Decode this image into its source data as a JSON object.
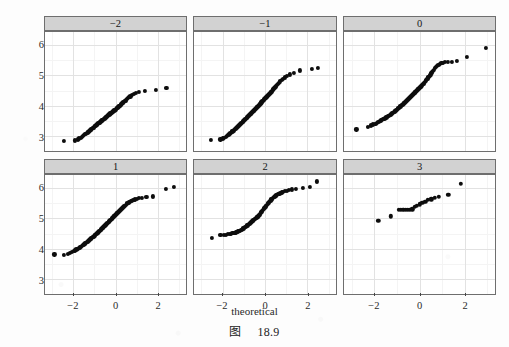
{
  "figure": {
    "caption_cjk": "图",
    "caption_number": "18.9"
  },
  "axes": {
    "x_label": "theoretical",
    "y_label": "sample",
    "x_ticks": [
      "-2",
      "0",
      "2"
    ],
    "x_tick_values": [
      -2,
      0,
      2
    ],
    "y_ticks": [
      "3",
      "4",
      "5",
      "6"
    ],
    "y_tick_values": [
      3,
      4,
      5,
      6
    ],
    "x_range": [
      -3.35,
      3.35
    ],
    "y_range": [
      2.52,
      6.42
    ],
    "x_minor_values": [
      -3,
      -1,
      1,
      3
    ],
    "y_minor_values": [
      2.5,
      3.5,
      4.5,
      5.5,
      6.5
    ]
  },
  "style": {
    "strip_background": "#d2d2d2",
    "panel_background": "#ffffff",
    "panel_border": "#6e6e6e",
    "grid_major": "#e2e2e2",
    "grid_minor": "#f4f4f4",
    "point_color": "#0d0d0d",
    "page_background": "#fdfdfd"
  },
  "chart_data": {
    "type": "scatter",
    "title": "",
    "subtitle": "",
    "xlabel": "theoretical",
    "ylabel": "sample",
    "xlim": [
      -3.35,
      3.35
    ],
    "ylim": [
      2.52,
      6.42
    ],
    "grid": true,
    "legend": "none",
    "facet_layout": {
      "rows": 2,
      "cols": 3,
      "strip_position": "top"
    },
    "annotations": [
      "图 18.9"
    ],
    "panels": [
      {
        "label": "-2",
        "row": 0,
        "col": 0,
        "n": 86,
        "x": [
          -2.45,
          -1.92,
          -1.8,
          -1.72,
          -1.66,
          -1.6,
          -1.55,
          -1.5,
          -1.46,
          -1.41,
          -1.37,
          -1.33,
          -1.29,
          -1.26,
          -1.22,
          -1.19,
          -1.15,
          -1.12,
          -1.09,
          -1.05,
          -1.02,
          -0.99,
          -0.96,
          -0.93,
          -0.9,
          -0.87,
          -0.84,
          -0.81,
          -0.78,
          -0.76,
          -0.73,
          -0.7,
          -0.67,
          -0.64,
          -0.62,
          -0.59,
          -0.56,
          -0.53,
          -0.51,
          -0.48,
          -0.45,
          -0.43,
          -0.4,
          -0.37,
          -0.35,
          -0.32,
          -0.29,
          -0.27,
          -0.24,
          -0.21,
          -0.19,
          -0.16,
          -0.13,
          -0.11,
          -0.08,
          -0.05,
          -0.03,
          0.0,
          0.03,
          0.05,
          0.08,
          0.11,
          0.13,
          0.16,
          0.19,
          0.21,
          0.24,
          0.27,
          0.3,
          0.33,
          0.36,
          0.4,
          0.43,
          0.47,
          0.51,
          0.55,
          0.6,
          0.65,
          0.71,
          0.78,
          0.87,
          0.98,
          1.13,
          1.38,
          1.92,
          2.42
        ],
        "y": [
          2.86,
          2.87,
          2.9,
          2.93,
          2.96,
          2.99,
          3.02,
          3.05,
          3.07,
          3.09,
          3.11,
          3.13,
          3.15,
          3.17,
          3.19,
          3.21,
          3.23,
          3.25,
          3.27,
          3.29,
          3.31,
          3.33,
          3.34,
          3.36,
          3.38,
          3.39,
          3.41,
          3.43,
          3.44,
          3.46,
          3.48,
          3.49,
          3.51,
          3.52,
          3.54,
          3.55,
          3.57,
          3.58,
          3.6,
          3.61,
          3.63,
          3.64,
          3.66,
          3.67,
          3.69,
          3.7,
          3.72,
          3.73,
          3.75,
          3.76,
          3.78,
          3.79,
          3.81,
          3.82,
          3.84,
          3.85,
          3.87,
          3.88,
          3.9,
          3.92,
          3.93,
          3.95,
          3.96,
          3.98,
          4.0,
          4.01,
          4.03,
          4.05,
          4.07,
          4.09,
          4.11,
          4.13,
          4.15,
          4.17,
          4.2,
          4.22,
          4.25,
          4.28,
          4.31,
          4.35,
          4.39,
          4.43,
          4.46,
          4.49,
          4.51,
          4.59
        ]
      },
      {
        "label": "-1",
        "row": 0,
        "col": 1,
        "n": 92,
        "x": [
          -2.55,
          -2.1,
          -2.0,
          -1.92,
          -1.85,
          -1.79,
          -1.73,
          -1.68,
          -1.63,
          -1.58,
          -1.54,
          -1.49,
          -1.45,
          -1.41,
          -1.37,
          -1.34,
          -1.3,
          -1.26,
          -1.23,
          -1.19,
          -1.16,
          -1.12,
          -1.09,
          -1.06,
          -1.03,
          -0.99,
          -0.96,
          -0.93,
          -0.9,
          -0.87,
          -0.84,
          -0.81,
          -0.78,
          -0.75,
          -0.72,
          -0.69,
          -0.66,
          -0.63,
          -0.61,
          -0.58,
          -0.55,
          -0.52,
          -0.49,
          -0.47,
          -0.44,
          -0.41,
          -0.38,
          -0.36,
          -0.33,
          -0.3,
          -0.28,
          -0.25,
          -0.22,
          -0.2,
          -0.17,
          -0.14,
          -0.12,
          -0.09,
          -0.06,
          -0.04,
          -0.01,
          0.02,
          0.04,
          0.07,
          0.1,
          0.12,
          0.15,
          0.18,
          0.21,
          0.24,
          0.27,
          0.3,
          0.33,
          0.36,
          0.39,
          0.42,
          0.46,
          0.49,
          0.53,
          0.57,
          0.62,
          0.67,
          0.72,
          0.78,
          0.85,
          0.93,
          1.03,
          1.16,
          1.35,
          1.65,
          2.2,
          2.48
        ],
        "y": [
          2.88,
          2.9,
          2.93,
          2.96,
          2.99,
          3.02,
          3.05,
          3.08,
          3.11,
          3.14,
          3.16,
          3.19,
          3.21,
          3.24,
          3.26,
          3.29,
          3.31,
          3.33,
          3.36,
          3.38,
          3.4,
          3.43,
          3.45,
          3.47,
          3.49,
          3.52,
          3.54,
          3.56,
          3.58,
          3.6,
          3.62,
          3.64,
          3.67,
          3.69,
          3.71,
          3.73,
          3.75,
          3.77,
          3.79,
          3.81,
          3.83,
          3.85,
          3.87,
          3.89,
          3.91,
          3.93,
          3.95,
          3.97,
          3.99,
          4.01,
          4.03,
          4.05,
          4.07,
          4.09,
          4.11,
          4.13,
          4.15,
          4.17,
          4.19,
          4.21,
          4.23,
          4.25,
          4.27,
          4.29,
          4.31,
          4.33,
          4.35,
          4.37,
          4.4,
          4.42,
          4.44,
          4.47,
          4.49,
          4.52,
          4.54,
          4.57,
          4.6,
          4.63,
          4.66,
          4.69,
          4.72,
          4.76,
          4.8,
          4.84,
          4.88,
          4.93,
          4.98,
          5.03,
          5.09,
          5.16,
          5.21,
          5.25
        ]
      },
      {
        "label": "0",
        "row": 0,
        "col": 2,
        "n": 96,
        "x": [
          -2.8,
          -2.3,
          -2.15,
          -2.05,
          -1.96,
          -1.89,
          -1.82,
          -1.76,
          -1.71,
          -1.66,
          -1.61,
          -1.56,
          -1.52,
          -1.47,
          -1.43,
          -1.39,
          -1.35,
          -1.32,
          -1.28,
          -1.24,
          -1.21,
          -1.17,
          -1.14,
          -1.1,
          -1.07,
          -1.04,
          -1.01,
          -0.97,
          -0.94,
          -0.91,
          -0.88,
          -0.85,
          -0.82,
          -0.79,
          -0.76,
          -0.73,
          -0.7,
          -0.67,
          -0.64,
          -0.62,
          -0.59,
          -0.56,
          -0.53,
          -0.5,
          -0.48,
          -0.45,
          -0.42,
          -0.39,
          -0.37,
          -0.34,
          -0.31,
          -0.29,
          -0.26,
          -0.23,
          -0.21,
          -0.18,
          -0.15,
          -0.13,
          -0.1,
          -0.07,
          -0.05,
          -0.02,
          0.01,
          0.04,
          0.06,
          0.09,
          0.12,
          0.15,
          0.18,
          0.21,
          0.24,
          0.27,
          0.3,
          0.33,
          0.36,
          0.39,
          0.42,
          0.46,
          0.49,
          0.53,
          0.56,
          0.6,
          0.64,
          0.69,
          0.73,
          0.78,
          0.84,
          0.9,
          0.97,
          1.05,
          1.14,
          1.26,
          1.42,
          1.66,
          2.1,
          2.95
        ],
        "y": [
          3.23,
          3.32,
          3.36,
          3.39,
          3.42,
          3.45,
          3.47,
          3.5,
          3.52,
          3.54,
          3.56,
          3.58,
          3.6,
          3.62,
          3.64,
          3.66,
          3.68,
          3.7,
          3.72,
          3.74,
          3.76,
          3.78,
          3.8,
          3.82,
          3.84,
          3.86,
          3.88,
          3.9,
          3.92,
          3.94,
          3.96,
          3.98,
          4.0,
          4.02,
          4.04,
          4.06,
          4.08,
          4.1,
          4.12,
          4.14,
          4.16,
          4.18,
          4.2,
          4.22,
          4.24,
          4.26,
          4.28,
          4.3,
          4.32,
          4.34,
          4.36,
          4.38,
          4.4,
          4.42,
          4.44,
          4.46,
          4.48,
          4.5,
          4.52,
          4.54,
          4.56,
          4.58,
          4.6,
          4.62,
          4.64,
          4.66,
          4.68,
          4.71,
          4.73,
          4.76,
          4.78,
          4.81,
          4.84,
          4.87,
          4.9,
          4.93,
          4.96,
          5.0,
          5.03,
          5.07,
          5.11,
          5.15,
          5.19,
          5.24,
          5.28,
          5.32,
          5.35,
          5.38,
          5.4,
          5.42,
          5.43,
          5.44,
          5.45,
          5.47,
          5.6,
          5.9
        ]
      },
      {
        "label": "1",
        "row": 1,
        "col": 0,
        "n": 94,
        "x": [
          -2.9,
          -2.45,
          -2.28,
          -2.16,
          -2.07,
          -1.99,
          -1.92,
          -1.86,
          -1.8,
          -1.75,
          -1.7,
          -1.65,
          -1.6,
          -1.56,
          -1.52,
          -1.48,
          -1.44,
          -1.4,
          -1.36,
          -1.33,
          -1.29,
          -1.26,
          -1.22,
          -1.19,
          -1.15,
          -1.12,
          -1.09,
          -1.05,
          -1.02,
          -0.99,
          -0.96,
          -0.92,
          -0.89,
          -0.86,
          -0.83,
          -0.8,
          -0.77,
          -0.74,
          -0.71,
          -0.68,
          -0.65,
          -0.62,
          -0.59,
          -0.56,
          -0.53,
          -0.5,
          -0.48,
          -0.45,
          -0.42,
          -0.39,
          -0.36,
          -0.33,
          -0.31,
          -0.28,
          -0.25,
          -0.22,
          -0.19,
          -0.17,
          -0.14,
          -0.11,
          -0.08,
          -0.05,
          -0.03,
          0.0,
          0.03,
          0.06,
          0.09,
          0.12,
          0.15,
          0.18,
          0.21,
          0.24,
          0.28,
          0.31,
          0.34,
          0.38,
          0.41,
          0.45,
          0.49,
          0.53,
          0.57,
          0.62,
          0.67,
          0.72,
          0.78,
          0.85,
          0.93,
          1.02,
          1.13,
          1.27,
          1.47,
          1.78,
          2.4,
          2.78
        ],
        "y": [
          3.82,
          3.8,
          3.83,
          3.86,
          3.89,
          3.92,
          3.95,
          3.98,
          4.0,
          4.03,
          4.05,
          4.07,
          4.1,
          4.12,
          4.14,
          4.16,
          4.18,
          4.2,
          4.22,
          4.24,
          4.26,
          4.28,
          4.3,
          4.32,
          4.34,
          4.36,
          4.38,
          4.4,
          4.42,
          4.44,
          4.46,
          4.48,
          4.5,
          4.52,
          4.54,
          4.56,
          4.58,
          4.6,
          4.62,
          4.64,
          4.66,
          4.68,
          4.7,
          4.72,
          4.74,
          4.76,
          4.78,
          4.8,
          4.82,
          4.84,
          4.86,
          4.88,
          4.9,
          4.92,
          4.94,
          4.96,
          4.98,
          5.0,
          5.02,
          5.04,
          5.06,
          5.08,
          5.1,
          5.12,
          5.14,
          5.16,
          5.18,
          5.2,
          5.22,
          5.24,
          5.26,
          5.28,
          5.3,
          5.33,
          5.35,
          5.37,
          5.4,
          5.42,
          5.45,
          5.47,
          5.5,
          5.52,
          5.54,
          5.56,
          5.58,
          5.6,
          5.62,
          5.64,
          5.66,
          5.68,
          5.7,
          5.72,
          5.96,
          6.02
        ]
      },
      {
        "label": "2",
        "row": 1,
        "col": 1,
        "n": 78,
        "x": [
          -2.52,
          -2.1,
          -1.95,
          -1.84,
          -1.75,
          -1.67,
          -1.6,
          -1.54,
          -1.48,
          -1.42,
          -1.37,
          -1.32,
          -1.27,
          -1.23,
          -1.18,
          -1.14,
          -1.1,
          -1.06,
          -1.02,
          -0.98,
          -0.94,
          -0.91,
          -0.87,
          -0.83,
          -0.8,
          -0.76,
          -0.73,
          -0.69,
          -0.66,
          -0.62,
          -0.59,
          -0.56,
          -0.52,
          -0.49,
          -0.46,
          -0.42,
          -0.39,
          -0.36,
          -0.33,
          -0.29,
          -0.26,
          -0.23,
          -0.2,
          -0.17,
          -0.13,
          -0.1,
          -0.07,
          -0.04,
          -0.01,
          0.03,
          0.06,
          0.09,
          0.12,
          0.16,
          0.19,
          0.23,
          0.26,
          0.3,
          0.33,
          0.37,
          0.41,
          0.45,
          0.49,
          0.53,
          0.58,
          0.62,
          0.68,
          0.73,
          0.79,
          0.86,
          0.94,
          1.03,
          1.14,
          1.28,
          1.47,
          1.78,
          2.1,
          2.45
        ],
        "y": [
          4.36,
          4.45,
          4.46,
          4.47,
          4.48,
          4.49,
          4.5,
          4.51,
          4.52,
          4.53,
          4.54,
          4.55,
          4.57,
          4.58,
          4.6,
          4.61,
          4.63,
          4.65,
          4.67,
          4.69,
          4.71,
          4.73,
          4.75,
          4.77,
          4.79,
          4.81,
          4.83,
          4.85,
          4.87,
          4.89,
          4.91,
          4.93,
          4.95,
          4.97,
          4.99,
          5.01,
          5.03,
          5.04,
          5.06,
          5.08,
          5.12,
          5.15,
          5.18,
          5.21,
          5.24,
          5.27,
          5.3,
          5.33,
          5.36,
          5.39,
          5.42,
          5.45,
          5.48,
          5.51,
          5.54,
          5.57,
          5.59,
          5.62,
          5.64,
          5.67,
          5.69,
          5.71,
          5.73,
          5.75,
          5.77,
          5.79,
          5.81,
          5.83,
          5.85,
          5.87,
          5.89,
          5.91,
          5.93,
          5.95,
          5.97,
          6.0,
          6.03,
          6.21
        ]
      },
      {
        "label": "3",
        "row": 1,
        "col": 2,
        "n": 20,
        "x": [
          -1.83,
          -1.28,
          -0.93,
          -0.83,
          -0.72,
          -0.62,
          -0.52,
          -0.42,
          -0.32,
          -0.22,
          -0.12,
          0.0,
          0.12,
          0.25,
          0.38,
          0.52,
          0.68,
          0.86,
          1.28,
          1.83
        ],
        "y": [
          4.92,
          5.06,
          5.28,
          5.28,
          5.28,
          5.28,
          5.28,
          5.28,
          5.3,
          5.38,
          5.42,
          5.46,
          5.5,
          5.55,
          5.6,
          5.62,
          5.68,
          5.7,
          5.78,
          6.13
        ]
      }
    ]
  }
}
